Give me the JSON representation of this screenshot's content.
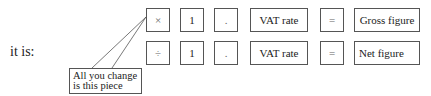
{
  "label": "it is:",
  "rows": [
    {
      "name": "gross",
      "cells": [
        "×",
        "1",
        ".",
        "VAT rate",
        "=",
        "Gross figure"
      ]
    },
    {
      "name": "net",
      "cells": [
        "÷",
        "1",
        ".",
        "VAT rate",
        "=",
        "Net figure"
      ]
    }
  ],
  "callout": {
    "line1": "All you change",
    "line2": "is this piece"
  }
}
